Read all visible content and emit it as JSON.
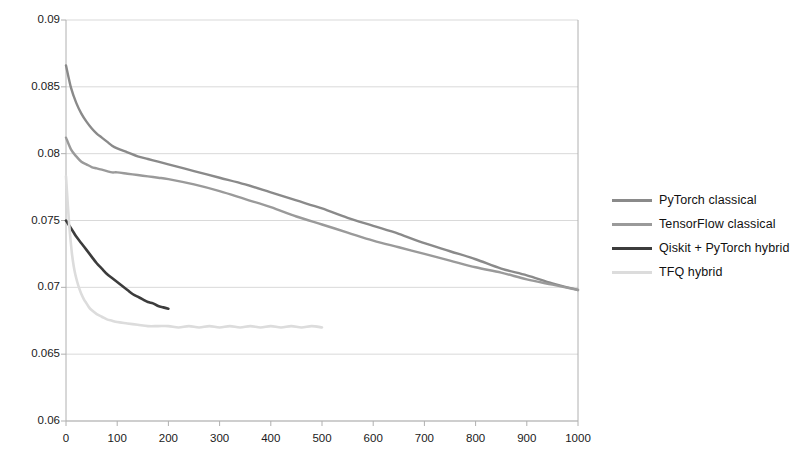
{
  "chart_data": {
    "type": "line",
    "title": "",
    "xlabel": "",
    "ylabel": "",
    "xlim": [
      0,
      1000
    ],
    "ylim": [
      0.06,
      0.09
    ],
    "grid": true,
    "legend_position": "right",
    "x_ticks": [
      "0",
      "100",
      "200",
      "300",
      "400",
      "500",
      "600",
      "700",
      "800",
      "900",
      "1000"
    ],
    "y_ticks": [
      "0.06",
      "0.065",
      "0.07",
      "0.075",
      "0.08",
      "0.085",
      "0.09"
    ],
    "series": [
      {
        "name": "PyTorch classical",
        "color": "#8a8a8a",
        "x": [
          0,
          10,
          20,
          30,
          40,
          50,
          60,
          70,
          80,
          90,
          100,
          120,
          140,
          160,
          180,
          200,
          250,
          300,
          350,
          400,
          450,
          500,
          550,
          600,
          650,
          700,
          750,
          800,
          850,
          900,
          950,
          1000
        ],
        "y": [
          0.0866,
          0.0849,
          0.0838,
          0.083,
          0.0824,
          0.0819,
          0.0815,
          0.0812,
          0.0809,
          0.0806,
          0.0804,
          0.0801,
          0.0798,
          0.0796,
          0.0794,
          0.0792,
          0.0787,
          0.0782,
          0.0777,
          0.0771,
          0.0765,
          0.0759,
          0.0752,
          0.0746,
          0.074,
          0.0733,
          0.0727,
          0.0721,
          0.0714,
          0.0709,
          0.0703,
          0.0698
        ]
      },
      {
        "name": "TensorFlow classical",
        "color": "#9a9a9a",
        "x": [
          0,
          10,
          20,
          30,
          40,
          50,
          60,
          70,
          80,
          90,
          100,
          120,
          140,
          160,
          180,
          200,
          250,
          300,
          350,
          400,
          450,
          500,
          550,
          600,
          650,
          700,
          750,
          800,
          850,
          900,
          950,
          1000
        ],
        "y": [
          0.0812,
          0.0803,
          0.0798,
          0.0794,
          0.0792,
          0.079,
          0.0789,
          0.0788,
          0.0787,
          0.0786,
          0.0786,
          0.0785,
          0.0784,
          0.0783,
          0.0782,
          0.0781,
          0.0777,
          0.0772,
          0.0766,
          0.076,
          0.0753,
          0.0747,
          0.0741,
          0.0735,
          0.073,
          0.0725,
          0.072,
          0.0715,
          0.0711,
          0.0706,
          0.0702,
          0.0698
        ]
      },
      {
        "name": "Qiskit + PyTorch hybrid",
        "color": "#3c3c3c",
        "x": [
          0,
          5,
          10,
          15,
          20,
          30,
          40,
          50,
          60,
          70,
          80,
          90,
          100,
          110,
          120,
          130,
          140,
          150,
          160,
          170,
          180,
          190,
          200
        ],
        "y": [
          0.075,
          0.0747,
          0.0744,
          0.0741,
          0.0738,
          0.0733,
          0.0728,
          0.0723,
          0.0718,
          0.0714,
          0.071,
          0.0707,
          0.0704,
          0.0701,
          0.0698,
          0.0695,
          0.0693,
          0.0691,
          0.0689,
          0.0688,
          0.0686,
          0.0685,
          0.0684
        ]
      },
      {
        "name": "TFQ hybrid",
        "color": "#dcdcdc",
        "x": [
          0,
          3,
          6,
          9,
          12,
          15,
          18,
          22,
          26,
          30,
          35,
          40,
          45,
          50,
          60,
          70,
          80,
          90,
          100,
          120,
          140,
          160,
          180,
          200,
          220,
          240,
          260,
          280,
          300,
          320,
          340,
          360,
          380,
          400,
          420,
          440,
          460,
          480,
          500
        ],
        "y": [
          0.0783,
          0.0765,
          0.0748,
          0.0735,
          0.0724,
          0.0716,
          0.071,
          0.0704,
          0.0699,
          0.0695,
          0.0691,
          0.0688,
          0.0685,
          0.0683,
          0.068,
          0.0678,
          0.0676,
          0.0675,
          0.0674,
          0.0673,
          0.0672,
          0.0671,
          0.0671,
          0.0671,
          0.067,
          0.0671,
          0.067,
          0.0671,
          0.067,
          0.0671,
          0.067,
          0.0671,
          0.067,
          0.0671,
          0.067,
          0.0671,
          0.067,
          0.0671,
          0.067
        ]
      }
    ]
  },
  "legend": {
    "items": [
      {
        "label": "PyTorch classical",
        "color": "#8a8a8a"
      },
      {
        "label": "TensorFlow classical",
        "color": "#9a9a9a"
      },
      {
        "label": "Qiskit + PyTorch hybrid",
        "color": "#3c3c3c"
      },
      {
        "label": "TFQ hybrid",
        "color": "#dcdcdc"
      }
    ]
  },
  "axes": {
    "grid_color": "#d9d9d9",
    "axis_color": "#b0b0b0"
  }
}
